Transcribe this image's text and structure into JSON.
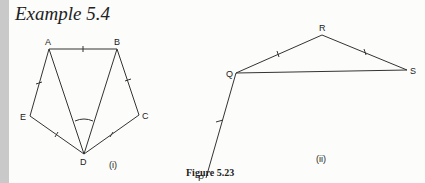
{
  "heading": "Example 5.4",
  "caption": "Figure 5.23",
  "figures": [
    {
      "id": "(i)",
      "points": {
        "A": "A",
        "B": "B",
        "C": "C",
        "D": "D",
        "E": "E"
      }
    },
    {
      "id": "(ii)",
      "points": {
        "P": "P",
        "Q": "Q",
        "R": "R",
        "S": "S"
      }
    }
  ]
}
